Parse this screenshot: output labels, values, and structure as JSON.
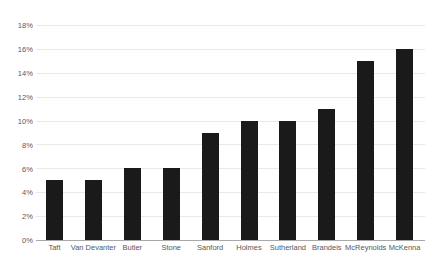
{
  "chart_data": {
    "type": "bar",
    "title": "",
    "subtitle": "",
    "xlabel": "",
    "ylabel": "",
    "categories": [
      "Taft",
      "Van Devanter",
      "Butler",
      "Stone",
      "Sanford",
      "Holmes",
      "Sutherland",
      "Brandeis",
      "McReynolds",
      "McKenna"
    ],
    "values": [
      5,
      5,
      6,
      6,
      9,
      10,
      10,
      11,
      15,
      16
    ],
    "value_unit": "%",
    "ylim": [
      0,
      18
    ],
    "ytick_step": 2,
    "ytick_labels": [
      "18%",
      "16%",
      "14%",
      "12%",
      "10%",
      "8%",
      "6%",
      "4%",
      "2%",
      "0%"
    ],
    "ytick_values": [
      18,
      16,
      14,
      12,
      10,
      8,
      6,
      4,
      2,
      0
    ],
    "grid": true,
    "grid_axis": "y",
    "legend": false,
    "legend_position": "none",
    "orientation": "vertical",
    "bar_color": "#1a1a1a",
    "gridline_color": "#e9e9e9",
    "axis_color": "#a8a8a8",
    "background_color": "#ffffff",
    "tick_label_color": "#58585a"
  }
}
